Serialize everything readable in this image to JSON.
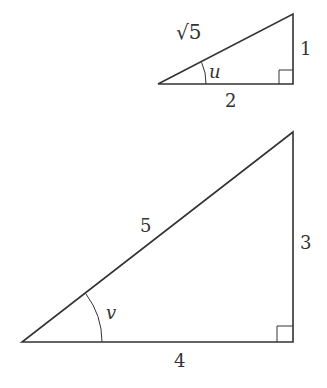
{
  "small_triangle": {
    "hypotenuse_label": "√5",
    "vertical_label": "1",
    "base_label": "2",
    "angle_label": "u"
  },
  "large_triangle": {
    "hypotenuse_label": "5",
    "vertical_label": "3",
    "base_label": "4",
    "angle_label": "v"
  },
  "colors": {
    "stroke": "#333333",
    "background": "#ffffff"
  }
}
